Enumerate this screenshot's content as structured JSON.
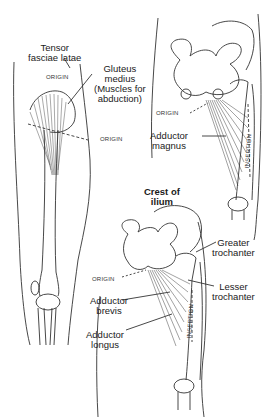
{
  "figures": [
    {
      "id": "abductors",
      "labels": {
        "tensor": "Tensor fasciae latae",
        "tensor_line1": "Tensor",
        "tensor_line2": "fasciae latae",
        "gluteus_line1": "Gluteus",
        "gluteus_line2": "medius",
        "gluteus_line3": "(Muscles for",
        "gluteus_line4": "abduction)",
        "origin_top": "ORIGIN",
        "origin_side": "ORIGIN"
      }
    },
    {
      "id": "adductor-magnus",
      "labels": {
        "origin": "ORIGIN",
        "muscle_line1": "Adductor",
        "muscle_line2": "magnus",
        "insertion": "INSERTION"
      }
    },
    {
      "id": "adductors-brevis-longus",
      "labels": {
        "crest_line1": "Crest of",
        "crest_line2": "ilium",
        "greater_line1": "Greater",
        "greater_line2": "trochanter",
        "lesser_line1": "Lesser",
        "lesser_line2": "trochanter",
        "origin": "ORIGIN",
        "brevis_line1": "Adductor",
        "brevis_line2": "brevis",
        "longus_line1": "Adductor",
        "longus_line2": "longus",
        "insertion": "INSERTION"
      }
    }
  ]
}
